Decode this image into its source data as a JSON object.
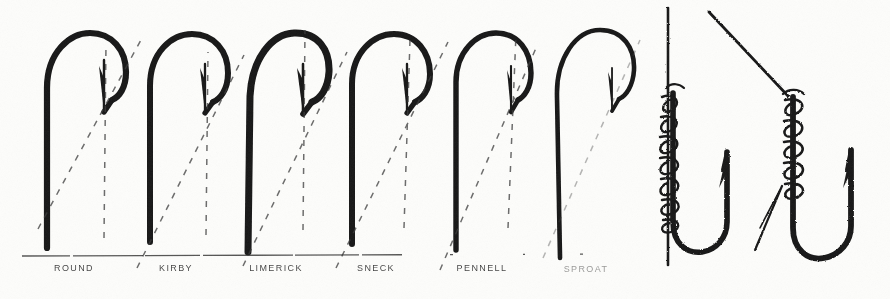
{
  "figure": {
    "kind": "vintage-engraving",
    "background_color": "#fdfdfb",
    "ink_color": "#141414",
    "left_panel": {
      "caption_rule": true,
      "hooks": [
        {
          "index": 0,
          "label": "ROUND",
          "bend": "round",
          "shank_x": 47,
          "point_x": 104
        },
        {
          "index": 1,
          "label": "KIRBY",
          "bend": "kirby",
          "shank_x": 150,
          "point_x": 205
        },
        {
          "index": 2,
          "label": "LIMERICK",
          "bend": "limerick",
          "shank_x": 248,
          "point_x": 300
        },
        {
          "index": 3,
          "label": "SNECK",
          "bend": "sneck",
          "shank_x": 352,
          "point_x": 404
        },
        {
          "index": 4,
          "label": "PENNELL",
          "bend": "pennell",
          "shank_x": 456,
          "point_x": 506
        },
        {
          "index": 5,
          "label": "SPROAT",
          "bend": "sproat-long",
          "shank_x": 556,
          "point_x": 608
        }
      ],
      "guide_lines": {
        "style": "dashed",
        "count": 11,
        "note": "diagonal and vertical dashed construction lines showing gape and point angle"
      }
    },
    "right_panel": {
      "items": [
        {
          "index": 0,
          "name": "hook-snelled-straight-line",
          "description": "hook whipped to a vertical line with coiled wraps"
        },
        {
          "index": 1,
          "name": "hook-snelled-angled-line",
          "description": "hook whipped to an angled line with coiled wraps and tag end"
        }
      ]
    }
  },
  "labels": {
    "items": [
      "ROUND",
      "KIRBY",
      "LIMERICK",
      "SNECK",
      "PENNELL",
      "SPROAT"
    ]
  }
}
